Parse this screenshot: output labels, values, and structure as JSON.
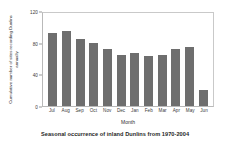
{
  "chart_data": {
    "type": "bar",
    "title": "Seasonal occurrence of inland Dunlins from 1970-2004",
    "xlabel": "Month",
    "ylabel": "Cumulative number of sites recording Dunlins annually",
    "categories": [
      "Jul",
      "Aug",
      "Sep",
      "Oct",
      "Nov",
      "Dec",
      "Jan",
      "Feb",
      "Mar",
      "Apr",
      "May",
      "Jun"
    ],
    "values": [
      94,
      97,
      87,
      81,
      73,
      66,
      68,
      64,
      66,
      73,
      76,
      21
    ],
    "ylim": [
      0,
      120
    ],
    "yticks": [
      0,
      40,
      80,
      120
    ],
    "ytick_labels": [
      "0",
      "40",
      "80",
      "120"
    ],
    "grid": false,
    "legend": "none",
    "bar_color": "#6e6e6e",
    "frame_color": "#b9b9b9",
    "background": "#ffffff"
  }
}
